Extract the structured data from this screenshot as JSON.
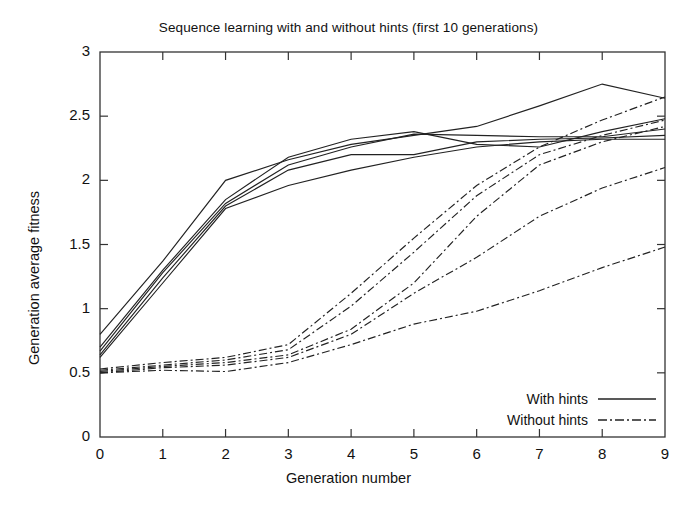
{
  "chart_data": {
    "type": "line",
    "title": "Sequence learning with and without hints (first 10 generations)",
    "xlabel": "Generation number",
    "ylabel": "Generation average fitness",
    "xlim": [
      0,
      9
    ],
    "ylim": [
      0,
      3
    ],
    "xticks": [
      "0",
      "1",
      "2",
      "3",
      "4",
      "5",
      "6",
      "7",
      "8",
      "9"
    ],
    "yticks": [
      "0",
      "0.5",
      "1",
      "1.5",
      "2",
      "2.5",
      "3"
    ],
    "grid": false,
    "legend_position": "bottom-right",
    "legend": [
      {
        "label": "With hints",
        "style": "solid"
      },
      {
        "label": "Without hints",
        "style": "dash-dot"
      }
    ],
    "x": [
      0,
      1,
      2,
      3,
      4,
      5,
      6,
      7,
      8,
      9
    ],
    "series": [
      {
        "name": "With hints run 1",
        "group": "With hints",
        "style": "solid",
        "values": [
          0.8,
          1.37,
          2.0,
          2.16,
          2.28,
          2.35,
          2.42,
          2.58,
          2.75,
          2.64
        ]
      },
      {
        "name": "With hints run 2",
        "group": "With hints",
        "style": "solid",
        "values": [
          0.7,
          1.3,
          1.85,
          2.18,
          2.32,
          2.38,
          2.28,
          2.26,
          2.38,
          2.48
        ]
      },
      {
        "name": "With hints run 3",
        "group": "With hints",
        "style": "solid",
        "values": [
          0.67,
          1.28,
          1.82,
          2.12,
          2.26,
          2.36,
          2.35,
          2.34,
          2.34,
          2.4
        ]
      },
      {
        "name": "With hints run 4",
        "group": "With hints",
        "style": "solid",
        "values": [
          0.64,
          1.24,
          1.8,
          2.08,
          2.2,
          2.2,
          2.3,
          2.32,
          2.33,
          2.35
        ]
      },
      {
        "name": "With hints run 5",
        "group": "With hints",
        "style": "solid",
        "values": [
          0.62,
          1.2,
          1.78,
          1.96,
          2.08,
          2.18,
          2.26,
          2.3,
          2.32,
          2.32
        ]
      },
      {
        "name": "Without hints run 1",
        "group": "Without hints",
        "style": "dash-dot",
        "values": [
          0.53,
          0.58,
          0.62,
          0.72,
          1.12,
          1.55,
          1.96,
          2.26,
          2.47,
          2.65
        ]
      },
      {
        "name": "Without hints run 2",
        "group": "Without hints",
        "style": "dash-dot",
        "values": [
          0.52,
          0.56,
          0.6,
          0.68,
          1.02,
          1.44,
          1.88,
          2.2,
          2.35,
          2.47
        ]
      },
      {
        "name": "Without hints run 3",
        "group": "Without hints",
        "style": "dash-dot",
        "values": [
          0.51,
          0.55,
          0.58,
          0.64,
          0.84,
          1.2,
          1.72,
          2.12,
          2.3,
          2.42
        ]
      },
      {
        "name": "Without hints run 4",
        "group": "Without hints",
        "style": "dash-dot",
        "values": [
          0.5,
          0.54,
          0.56,
          0.62,
          0.8,
          1.12,
          1.4,
          1.72,
          1.94,
          2.1
        ]
      },
      {
        "name": "Without hints run 5",
        "group": "Without hints",
        "style": "dash-dot",
        "values": [
          0.5,
          0.52,
          0.51,
          0.58,
          0.72,
          0.88,
          0.98,
          1.14,
          1.32,
          1.48
        ]
      }
    ]
  }
}
